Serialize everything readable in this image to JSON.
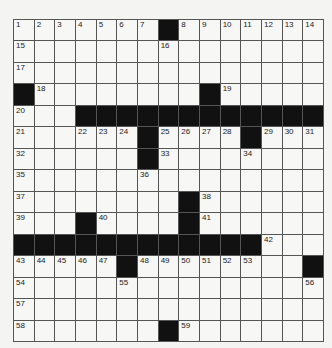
{
  "puzzle": {
    "rows": 15,
    "cols": 15,
    "blocks": [
      [
        0,
        7
      ],
      [
        3,
        0
      ],
      [
        3,
        9
      ],
      [
        4,
        3
      ],
      [
        4,
        4
      ],
      [
        4,
        5
      ],
      [
        4,
        6
      ],
      [
        4,
        7
      ],
      [
        4,
        8
      ],
      [
        4,
        9
      ],
      [
        4,
        10
      ],
      [
        4,
        11
      ],
      [
        4,
        12
      ],
      [
        4,
        13
      ],
      [
        4,
        14
      ],
      [
        5,
        6
      ],
      [
        5,
        11
      ],
      [
        6,
        6
      ],
      [
        8,
        8
      ],
      [
        9,
        3
      ],
      [
        9,
        8
      ],
      [
        10,
        0
      ],
      [
        10,
        1
      ],
      [
        10,
        2
      ],
      [
        10,
        3
      ],
      [
        10,
        4
      ],
      [
        10,
        5
      ],
      [
        10,
        6
      ],
      [
        10,
        7
      ],
      [
        10,
        8
      ],
      [
        10,
        9
      ],
      [
        10,
        10
      ],
      [
        10,
        11
      ],
      [
        11,
        5
      ],
      [
        11,
        14
      ],
      [
        14,
        7
      ]
    ],
    "numbers": [
      {
        "r": 0,
        "c": 0,
        "n": "1"
      },
      {
        "r": 0,
        "c": 1,
        "n": "2"
      },
      {
        "r": 0,
        "c": 2,
        "n": "3"
      },
      {
        "r": 0,
        "c": 3,
        "n": "4"
      },
      {
        "r": 0,
        "c": 4,
        "n": "5"
      },
      {
        "r": 0,
        "c": 5,
        "n": "6"
      },
      {
        "r": 0,
        "c": 6,
        "n": "7"
      },
      {
        "r": 0,
        "c": 8,
        "n": "8"
      },
      {
        "r": 0,
        "c": 9,
        "n": "9"
      },
      {
        "r": 0,
        "c": 10,
        "n": "10"
      },
      {
        "r": 0,
        "c": 11,
        "n": "11"
      },
      {
        "r": 0,
        "c": 12,
        "n": "12"
      },
      {
        "r": 0,
        "c": 13,
        "n": "13"
      },
      {
        "r": 0,
        "c": 14,
        "n": "14"
      },
      {
        "r": 1,
        "c": 0,
        "n": "15"
      },
      {
        "r": 1,
        "c": 7,
        "n": "16"
      },
      {
        "r": 2,
        "c": 0,
        "n": "17"
      },
      {
        "r": 3,
        "c": 1,
        "n": "18"
      },
      {
        "r": 3,
        "c": 10,
        "n": "19"
      },
      {
        "r": 4,
        "c": 0,
        "n": "20"
      },
      {
        "r": 5,
        "c": 0,
        "n": "21"
      },
      {
        "r": 5,
        "c": 3,
        "n": "22"
      },
      {
        "r": 5,
        "c": 4,
        "n": "23"
      },
      {
        "r": 5,
        "c": 5,
        "n": "24"
      },
      {
        "r": 5,
        "c": 7,
        "n": "25"
      },
      {
        "r": 5,
        "c": 8,
        "n": "26"
      },
      {
        "r": 5,
        "c": 9,
        "n": "27"
      },
      {
        "r": 5,
        "c": 10,
        "n": "28"
      },
      {
        "r": 5,
        "c": 12,
        "n": "29"
      },
      {
        "r": 5,
        "c": 13,
        "n": "30"
      },
      {
        "r": 5,
        "c": 14,
        "n": "31"
      },
      {
        "r": 6,
        "c": 0,
        "n": "32"
      },
      {
        "r": 6,
        "c": 7,
        "n": "33"
      },
      {
        "r": 6,
        "c": 11,
        "n": "34"
      },
      {
        "r": 7,
        "c": 0,
        "n": "35"
      },
      {
        "r": 7,
        "c": 6,
        "n": "36"
      },
      {
        "r": 8,
        "c": 0,
        "n": "37"
      },
      {
        "r": 8,
        "c": 9,
        "n": "38"
      },
      {
        "r": 9,
        "c": 0,
        "n": "39"
      },
      {
        "r": 9,
        "c": 4,
        "n": "40"
      },
      {
        "r": 9,
        "c": 9,
        "n": "41"
      },
      {
        "r": 10,
        "c": 12,
        "n": "42"
      },
      {
        "r": 11,
        "c": 0,
        "n": "43"
      },
      {
        "r": 11,
        "c": 1,
        "n": "44"
      },
      {
        "r": 11,
        "c": 2,
        "n": "45"
      },
      {
        "r": 11,
        "c": 3,
        "n": "46"
      },
      {
        "r": 11,
        "c": 4,
        "n": "47"
      },
      {
        "r": 11,
        "c": 6,
        "n": "48"
      },
      {
        "r": 11,
        "c": 7,
        "n": "49"
      },
      {
        "r": 11,
        "c": 8,
        "n": "50"
      },
      {
        "r": 11,
        "c": 9,
        "n": "51"
      },
      {
        "r": 11,
        "c": 10,
        "n": "52"
      },
      {
        "r": 11,
        "c": 11,
        "n": "53"
      },
      {
        "r": 12,
        "c": 0,
        "n": "54"
      },
      {
        "r": 12,
        "c": 5,
        "n": "55"
      },
      {
        "r": 12,
        "c": 14,
        "n": "56"
      },
      {
        "r": 13,
        "c": 0,
        "n": "57"
      },
      {
        "r": 14,
        "c": 0,
        "n": "58"
      },
      {
        "r": 14,
        "c": 8,
        "n": "59"
      }
    ]
  }
}
